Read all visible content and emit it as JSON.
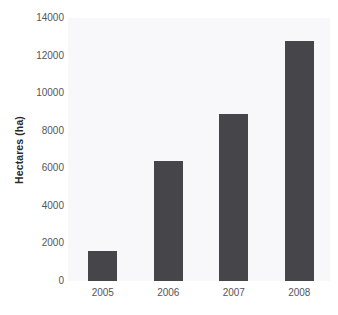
{
  "chart_data": {
    "type": "bar",
    "title": "",
    "xlabel": "",
    "ylabel": "Hectares (ha)",
    "categories": [
      "2005",
      "2006",
      "2007",
      "2008"
    ],
    "values": [
      1600,
      6400,
      8900,
      12800
    ],
    "ylim": [
      0,
      14000
    ],
    "yticks": [
      0,
      2000,
      4000,
      6000,
      8000,
      10000,
      12000,
      14000
    ],
    "ytick_labels": [
      "0",
      "2000",
      "4000",
      "6000",
      "8000",
      "10000",
      "12000",
      "14000"
    ],
    "grid": false,
    "legend": false,
    "legend_position": "none",
    "series": [
      {
        "name": "Hectares (ha)",
        "values": [
          1600,
          6400,
          8900,
          12800
        ]
      }
    ],
    "colors": {
      "bar_fill": "#46464a",
      "plot_background": "#f8f8fa",
      "figure_background": "#ffffff",
      "tick_label": "#55555a",
      "axis_title": "#2b2b2b"
    }
  }
}
